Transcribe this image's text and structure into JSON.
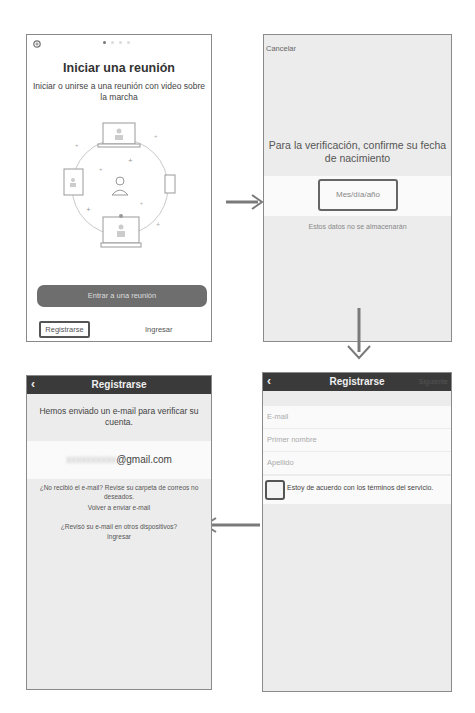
{
  "screen_start": {
    "settings_icon": "gear-icon",
    "page_dots": {
      "count": 4,
      "active": 0
    },
    "title": "Iniciar una reunión",
    "subtitle": "Iniciar o unirse a una reunión con video sobre la marcha",
    "join_button": "Entrar a una reunión",
    "register_button": "Registrarse",
    "login_link": "Ingresar"
  },
  "screen_birthdate": {
    "cancel": "Cancelar",
    "prompt": "Para la verificación, confirme su fecha de nacimiento",
    "date_placeholder": "Mes/día/año",
    "note": "Estos datos no se almacenarán"
  },
  "screen_register_form": {
    "back_icon": "chevron-left-icon",
    "title": "Registrarse",
    "next": "Siguiente",
    "fields": [
      {
        "placeholder": "E-mail"
      },
      {
        "placeholder": "Primer nombre"
      },
      {
        "placeholder": "Apellido"
      }
    ],
    "terms_label": "Estoy de acuerdo con los términos del servicio."
  },
  "screen_email_sent": {
    "back_icon": "chevron-left-icon",
    "title": "Registrarse",
    "message": "Hemos enviado un e-mail para verificar su cuenta.",
    "email_hidden": "xxxxxxxxxx",
    "email_domain": "@gmail.com",
    "not_received": "¿No recibió el e-mail? Revise su carpeta de correos no deseados.",
    "resend": "Volver a enviar e-mail",
    "checked_other": "¿Revisó su e-mail en otros dispositivos?",
    "login": "Ingresar"
  },
  "colors": {
    "navbar": "#3a3a3a",
    "button_dark": "#6e6e6e",
    "panel_bg": "#ececec",
    "arrow": "#7a7a7a"
  }
}
